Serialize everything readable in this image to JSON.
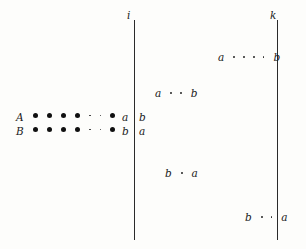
{
  "figure": {
    "background_color": "#fdfdfb",
    "ink_color": "#1a1a1a",
    "vertical_lines": [
      {
        "id": "line-i",
        "label": "i",
        "x": 134,
        "y_top": 20,
        "y_bottom": 240
      },
      {
        "id": "line-k",
        "label": "k",
        "x": 277,
        "y_top": 20,
        "y_bottom": 240
      }
    ],
    "rows": [
      {
        "id": "row-A",
        "label": "A",
        "label_x": 16,
        "y": 114,
        "dots_x": 33,
        "big_dots_left": 4,
        "separator_dots": 2,
        "big_dots_right": 1,
        "left_of_line": "a",
        "right_of_line": "b"
      },
      {
        "id": "row-B",
        "label": "B",
        "label_x": 16,
        "y": 128,
        "dots_x": 33,
        "big_dots_left": 4,
        "separator_dots": 2,
        "big_dots_right": 1,
        "left_of_line": "b",
        "right_of_line": "a"
      }
    ],
    "sequences": [
      {
        "id": "seq-top-right",
        "start": "a",
        "end": "b",
        "dots": 4,
        "x": 218,
        "y": 52,
        "end_crosses_line": "line-k"
      },
      {
        "id": "seq-upper-mid",
        "start": "a",
        "end": "b",
        "dots": 2,
        "x": 155,
        "y": 88,
        "end_crosses_line": null
      },
      {
        "id": "seq-lower-mid",
        "start": "b",
        "end": "a",
        "dots": 1,
        "x": 165,
        "y": 168,
        "end_crosses_line": null
      },
      {
        "id": "seq-bottom-right",
        "start": "b",
        "end": "a",
        "dots": 2,
        "x": 245,
        "y": 212,
        "end_crosses_line": "line-k"
      }
    ]
  }
}
